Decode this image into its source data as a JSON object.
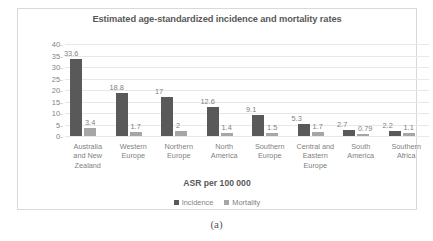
{
  "chart_data": {
    "type": "bar",
    "title": "Estimated age-standardized incidence and mortality rates",
    "xlabel": "ASR per 100 000",
    "ylabel": "World areas",
    "ylim": [
      0,
      40
    ],
    "yticks": [
      40,
      35,
      30,
      25,
      20,
      15,
      10,
      5,
      0
    ],
    "grid": true,
    "legend_position": "bottom",
    "categories": [
      "Australia and New Zealand",
      "Western Europe",
      "Northern Europe",
      "North America",
      "Southern Europe",
      "Central and Eastern Europe",
      "South America",
      "Southern Africa"
    ],
    "category_lines": [
      [
        "Australia",
        "and New",
        "Zealand"
      ],
      [
        "Western",
        "Europe"
      ],
      [
        "Northern",
        "Europe"
      ],
      [
        "North",
        "America"
      ],
      [
        "Southern",
        "Europe"
      ],
      [
        "Central and",
        "Eastern",
        "Europe"
      ],
      [
        "South",
        "America"
      ],
      [
        "Southern",
        "Africa"
      ]
    ],
    "series": [
      {
        "name": "Incidence",
        "color": "#595959",
        "values": [
          33.6,
          18.8,
          17,
          12.6,
          9.1,
          5.3,
          2.7,
          2.2
        ],
        "labels": [
          "33.6",
          "18.8",
          "17",
          "12.6",
          "9.1",
          "5.3",
          "2.7",
          "2.2"
        ]
      },
      {
        "name": "Mortality",
        "color": "#a6a6a6",
        "values": [
          3.4,
          1.7,
          2,
          1.4,
          1.5,
          1.7,
          0.79,
          1.1
        ],
        "labels": [
          "3.4",
          "1.7",
          "2",
          "1.4",
          "1.5",
          "1.7",
          "0.79",
          "1.1"
        ]
      }
    ]
  },
  "figure": {
    "caption": "(a)"
  }
}
